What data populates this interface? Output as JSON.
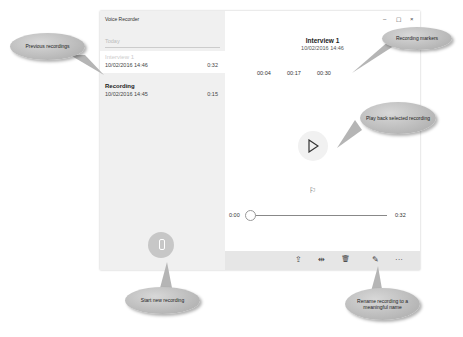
{
  "app": {
    "title": "Voice Recorder"
  },
  "list": {
    "group_label": "Today",
    "recordings": [
      {
        "name": "Interview 1",
        "date": "10/02/2016 14:46",
        "duration": "0:32",
        "selected": true
      },
      {
        "name": "Recording",
        "date": "10/02/2016 14:45",
        "duration": "0:15",
        "selected": false
      }
    ]
  },
  "window_controls": {
    "minimize": "–",
    "maximize": "☐",
    "close": "×"
  },
  "detail": {
    "title": "Interview 1",
    "date": "10/02/2016 14:46",
    "markers": [
      "00:04",
      "00:17",
      "00:30"
    ],
    "start_time": "0:00",
    "end_time": "0:32"
  },
  "command_bar": {
    "share": "⇪",
    "trim": "⇹",
    "delete": "🗑",
    "rename": "✎",
    "more": "···"
  },
  "callouts": {
    "previous": "Previous recordings",
    "markers": "Recording markers",
    "play": "Play back selected recording",
    "start": "Start new recording",
    "rename": "Rename recording to a meaningful name"
  }
}
